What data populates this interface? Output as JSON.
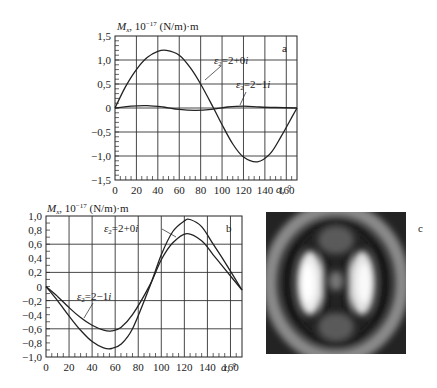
{
  "chart_data": [
    {
      "panel": "a",
      "type": "line",
      "ylabel": "M_x, 10^-17 (N/m)·m",
      "xlabel": "α, °",
      "xlim": [
        0,
        170
      ],
      "ylim": [
        -1.5,
        1.5
      ],
      "x_ticks": [
        "0",
        "20",
        "40",
        "60",
        "80",
        "100",
        "120",
        "140",
        "160"
      ],
      "y_ticks": [
        "1,5",
        "1,0",
        "0,5",
        "0",
        "−0,5",
        "−1,0",
        "−1,5"
      ],
      "grid": true,
      "series": [
        {
          "name": "ε2=2+0i",
          "x": [
            0,
            10,
            20,
            30,
            40,
            48,
            60,
            70,
            80,
            92,
            100,
            110,
            120,
            133,
            145,
            155,
            165,
            170
          ],
          "values": [
            0,
            0.45,
            0.8,
            1.05,
            1.18,
            1.2,
            1.1,
            0.85,
            0.5,
            0,
            -0.35,
            -0.75,
            -1.02,
            -1.12,
            -0.95,
            -0.6,
            -0.2,
            0
          ]
        },
        {
          "name": "ε2=2−1i",
          "x": [
            0,
            15,
            30,
            45,
            60,
            75,
            90,
            105,
            120,
            135,
            150,
            170
          ],
          "values": [
            0,
            0.04,
            0.05,
            0.02,
            -0.03,
            -0.05,
            -0.03,
            0.02,
            0.04,
            0.02,
            0.01,
            0
          ]
        }
      ]
    },
    {
      "panel": "b",
      "type": "line",
      "ylabel": "M_x, 10^-17 (N/m)·m",
      "xlabel": "α, °",
      "xlim": [
        0,
        170
      ],
      "ylim": [
        -1.0,
        1.0
      ],
      "x_ticks": [
        "0",
        "20",
        "40",
        "60",
        "80",
        "100",
        "120",
        "140",
        "160"
      ],
      "y_ticks": [
        "1,0",
        "0,8",
        "0,6",
        "0,4",
        "0,2",
        "0",
        "−0,2",
        "−0,4",
        "−0,6",
        "−0,8",
        "−1,0"
      ],
      "grid": true,
      "series": [
        {
          "name": "ε2=2+0i",
          "x": [
            0,
            10,
            20,
            30,
            40,
            50,
            57,
            65,
            75,
            90,
            100,
            110,
            120,
            125,
            135,
            145,
            155,
            170
          ],
          "values": [
            0,
            -0.2,
            -0.42,
            -0.62,
            -0.78,
            -0.87,
            -0.88,
            -0.82,
            -0.6,
            0,
            0.45,
            0.78,
            0.93,
            0.95,
            0.85,
            0.6,
            0.35,
            -0.05
          ]
        },
        {
          "name": "ε2=2−1i",
          "x": [
            0,
            10,
            20,
            30,
            40,
            50,
            57,
            65,
            75,
            90,
            100,
            110,
            122,
            135,
            145,
            155,
            170
          ],
          "values": [
            0,
            -0.14,
            -0.3,
            -0.44,
            -0.55,
            -0.62,
            -0.63,
            -0.58,
            -0.4,
            0.02,
            0.38,
            0.62,
            0.75,
            0.65,
            0.45,
            0.25,
            -0.05
          ]
        }
      ]
    }
  ],
  "panels": {
    "a": {
      "letter": "a",
      "ylabel_main": "M",
      "ylabel_sub": "x",
      "ylabel_rest": ", 10",
      "ylabel_exp": "−17",
      "ylabel_unit": " (N/m)·m",
      "xlabel": "α, °",
      "series_labels": [
        "ε₂=2+0i",
        "ε₂=2−1i"
      ]
    },
    "b": {
      "letter": "b",
      "ylabel_main": "M",
      "ylabel_sub": "x",
      "ylabel_rest": ", 10",
      "ylabel_exp": "−17",
      "ylabel_unit": " (N/m)·m",
      "xlabel": "α, °",
      "series_labels": [
        "ε₂=2+0i",
        "ε₂=2−1i"
      ]
    },
    "c": {
      "letter": "c",
      "description": "grayscale interference/field-intensity image with concentric bright lobes"
    }
  }
}
